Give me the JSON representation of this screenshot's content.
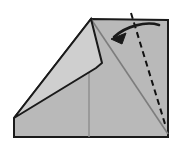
{
  "figure": {
    "width": 179,
    "height": 147
  },
  "colors": {
    "background": "#ffffff",
    "body_fill": "#b9b9b9",
    "flap_fill": "#cfcfcf",
    "outline": "#1a1a1a",
    "crease_line": "#7d7d7d",
    "dashed_line": "#111111",
    "arrow": "#1a1a1a"
  },
  "shapes": {
    "paper_body": {
      "name": "folded-paper-body",
      "points": "91,19 168,20 168,137 14,137 14,118"
    },
    "paper_flap": {
      "name": "folded-paper-flap",
      "points": "91,19 102,63 96,68 14,118"
    },
    "crease_main": {
      "name": "main-crease-line",
      "x1": 91,
      "y1": 19,
      "x2": 168,
      "y2": 134
    },
    "crease_vertical": {
      "name": "vertical-crease-line",
      "x1": 89,
      "y1": 68,
      "x2": 89,
      "y2": 137
    },
    "fold_line_dashed": {
      "name": "dashed-fold-line",
      "x1": 131,
      "y1": 13,
      "x2": 165,
      "y2": 124,
      "dash_pattern": "6,4",
      "stroke_width": 2
    },
    "fold_arrow": {
      "name": "fold-direction-arrow",
      "path": "M 159 25 C 146 21 126 26 114 37",
      "head": "113,38 125,34 121,43",
      "stroke_width": 2.6
    }
  },
  "labels": {
    "body": "paper body",
    "flap": "folded flap",
    "fold_line": "fold along dashed line",
    "arrow": "fold direction"
  }
}
